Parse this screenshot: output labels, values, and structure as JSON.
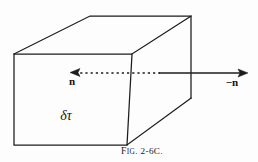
{
  "figure": {
    "caption": "FIG. 2-6C.",
    "caption_display": "F",
    "background_color": "#fdfdfd",
    "ink_color": "#1c1c1c",
    "labels": {
      "inward_normal": "n",
      "outward_normal": "−n",
      "volume_element": "δτ"
    },
    "caption_parts": {
      "lead": "F",
      "smallcaps": "IG",
      "number": ". 2-6C."
    }
  },
  "geometry": {
    "type": "parallelepiped-wireframe",
    "front_face": {
      "top_left": [
        14,
        54
      ],
      "top_right": [
        132,
        54
      ],
      "bottom_right": [
        127,
        145
      ],
      "bottom_left": [
        14,
        145
      ]
    },
    "back_face": {
      "top_left": [
        90,
        16
      ],
      "top_right": [
        191,
        16
      ],
      "bottom_right": [
        191,
        98
      ]
    },
    "normal_axis": {
      "y": 73,
      "dotted_from_x": 74,
      "dotted_to_x": 160,
      "solid_from_x": 160,
      "solid_to_x": 245,
      "left_arrow_tip_x": 70,
      "right_arrow_tip_x": 248
    }
  }
}
